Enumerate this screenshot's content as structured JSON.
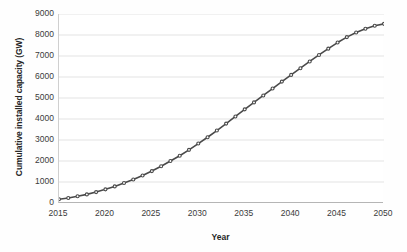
{
  "chart_data": {
    "type": "line",
    "title": "",
    "subtitle": "",
    "xlabel": "Year",
    "ylabel": "Cumulative installed capacity (GW)",
    "xlim": [
      2015,
      2050
    ],
    "ylim": [
      0,
      9000
    ],
    "xticks": [
      "2015",
      "2020",
      "2025",
      "2030",
      "2035",
      "2040",
      "2045",
      "2050"
    ],
    "xtick_values": [
      2015,
      2020,
      2025,
      2030,
      2035,
      2040,
      2045,
      2050
    ],
    "yticks": [
      "0",
      "1000",
      "2000",
      "3000",
      "4000",
      "5000",
      "6000",
      "7000",
      "8000",
      "9000"
    ],
    "ytick_values": [
      0,
      1000,
      2000,
      3000,
      4000,
      5000,
      6000,
      7000,
      8000,
      9000
    ],
    "grid": "horizontal",
    "legend": "none",
    "annotations": [],
    "series": [
      {
        "name": "Cumulative installed capacity",
        "color": "#4a4a4a",
        "marker": "circle",
        "x": [
          2015,
          2016,
          2017,
          2018,
          2019,
          2020,
          2021,
          2022,
          2023,
          2024,
          2025,
          2026,
          2027,
          2028,
          2029,
          2030,
          2031,
          2032,
          2033,
          2034,
          2035,
          2036,
          2037,
          2038,
          2039,
          2040,
          2041,
          2042,
          2043,
          2044,
          2045,
          2046,
          2047,
          2048,
          2049,
          2050
        ],
        "values": [
          180,
          240,
          320,
          410,
          520,
          650,
          790,
          950,
          1120,
          1310,
          1520,
          1750,
          2000,
          2250,
          2530,
          2830,
          3130,
          3450,
          3780,
          4120,
          4460,
          4790,
          5120,
          5450,
          5780,
          6100,
          6420,
          6740,
          7050,
          7350,
          7640,
          7900,
          8120,
          8300,
          8440,
          8530
        ]
      }
    ]
  },
  "axes": {
    "y_title": "Cumulative installed capacity (GW)",
    "x_title": "Year"
  },
  "colors": {
    "line": "#4a4a4a",
    "grid": "#e3e3e3",
    "axis": "#bdbdbd",
    "text": "#3b3b3b",
    "background": "#ffffff"
  }
}
